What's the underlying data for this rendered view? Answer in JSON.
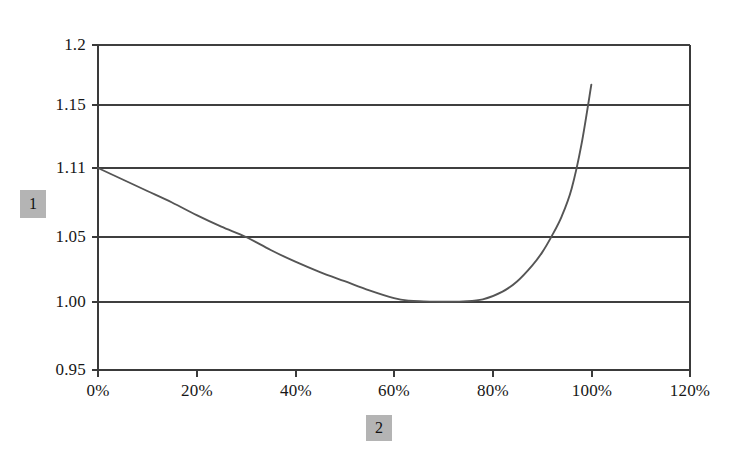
{
  "chart_data": {
    "type": "line",
    "title": "",
    "subtitle": "",
    "xlabel": "2",
    "ylabel": "1",
    "grid": true,
    "legend": false,
    "legend_position": "none",
    "xlim": [
      0,
      120
    ],
    "ylim": [
      0.95,
      1.2
    ],
    "x_tick_labels": [
      "0%",
      "20%",
      "40%",
      "60%",
      "80%",
      "100%",
      "120%"
    ],
    "x_tick_values": [
      0,
      20,
      40,
      60,
      80,
      100,
      120
    ],
    "y_tick_labels": [
      "1.2",
      "1.15",
      "1.11",
      "1.05",
      "1.00",
      "0.95"
    ],
    "y_tick_values": [
      1.2,
      1.15,
      1.11,
      1.05,
      1.0,
      0.95
    ],
    "x_unit": "percent",
    "series": [
      {
        "name": "curve",
        "color": "#555555",
        "x": [
          0,
          5,
          10,
          15,
          20,
          25,
          30,
          35,
          40,
          45,
          50,
          55,
          60,
          63,
          66,
          70,
          74,
          78,
          82,
          85,
          88,
          90,
          92,
          94,
          96,
          98,
          100
        ],
        "y": [
          1.11,
          1.1,
          1.09,
          1.08,
          1.069,
          1.059,
          1.05,
          1.04,
          1.031,
          1.023,
          1.016,
          1.009,
          1.003,
          1.001,
          1.0005,
          1.0002,
          1.0005,
          1.002,
          1.008,
          1.016,
          1.028,
          1.038,
          1.051,
          1.068,
          1.092,
          1.125,
          1.167
        ]
      }
    ],
    "annotations": {
      "start_point": {
        "x": 0,
        "y": 1.11
      },
      "minimum_point": {
        "x": 70,
        "y": 1.0
      },
      "end_point": {
        "x": 100,
        "y": 1.167
      }
    }
  },
  "axis_titles": {
    "y_placeholder": "1",
    "x_placeholder": "2"
  },
  "colors": {
    "axis": "#3a3a3a",
    "gridline": "#3f3f3f",
    "curve": "#555555",
    "placeholder_box": "#b4b4b4",
    "background": "#ffffff"
  }
}
